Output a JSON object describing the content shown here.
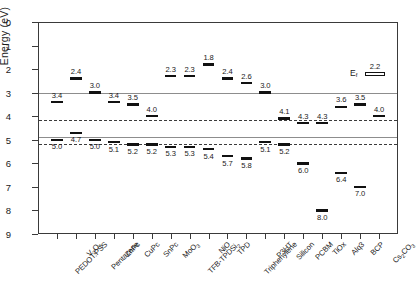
{
  "chart_data": {
    "type": "bar",
    "title": "",
    "xlabel": "",
    "ylabel": "Energy (eV)",
    "ylim": [
      0,
      9
    ],
    "y_inverted": true,
    "grid": false,
    "legend": null,
    "y_ticks": [
      "0",
      "1",
      "2",
      "3",
      "4",
      "5",
      "6",
      "7",
      "8",
      "9"
    ],
    "categories": [
      "PEDOT:PSS",
      "V₂O₅",
      "Pentacene",
      "ZnPc",
      "CuPc",
      "SnPc",
      "MoO₃",
      "TFB-TPDSi₂",
      "NiO",
      "TPD",
      "Triphenylene",
      "P3HT",
      "Silicon",
      "PCBM",
      "TiOx",
      "Alq3",
      "BCP",
      "Cs₂CO₃"
    ],
    "series": [
      {
        "name": "LUMO / conduction level",
        "values": [
          3.4,
          2.4,
          3.0,
          3.4,
          3.5,
          4.0,
          2.3,
          2.3,
          1.8,
          2.4,
          2.6,
          3.0,
          4.1,
          4.3,
          4.3,
          3.6,
          3.5,
          4.0
        ]
      },
      {
        "name": "HOMO / valence level",
        "values": [
          5.0,
          4.7,
          5.0,
          5.1,
          5.2,
          5.2,
          5.3,
          5.3,
          5.4,
          5.7,
          5.8,
          5.1,
          5.2,
          6.0,
          8.0,
          6.4,
          7.0,
          null
        ]
      }
    ],
    "reference_lines": [
      {
        "value": 3.0,
        "style": "solid"
      },
      {
        "value": 4.15,
        "style": "dashed"
      },
      {
        "value": 4.9,
        "style": "solid"
      },
      {
        "value": 5.2,
        "style": "dashed"
      }
    ],
    "highlight_band": {
      "from_category": "P3HT",
      "to_category": "Silicon"
    },
    "annotations": [
      {
        "name": "fermi-level",
        "label": "E",
        "sublabel": "f",
        "value": 2.2
      }
    ]
  },
  "axes": {
    "y_title": "Energy (eV)",
    "y_tick_labels": [
      "0",
      "1",
      "2",
      "3",
      "4",
      "5",
      "6",
      "7",
      "8",
      "9"
    ]
  },
  "fermi": {
    "label": "E",
    "sublabel": "f",
    "value_text": "2.2"
  },
  "colors": {
    "bar": "#111111",
    "frame": "#3a3a3a",
    "reference_solid": "#8d8d8d",
    "reference_dashed": "#3b3b3b",
    "highlight_band": "#d9dde1",
    "background": "#ffffff"
  }
}
